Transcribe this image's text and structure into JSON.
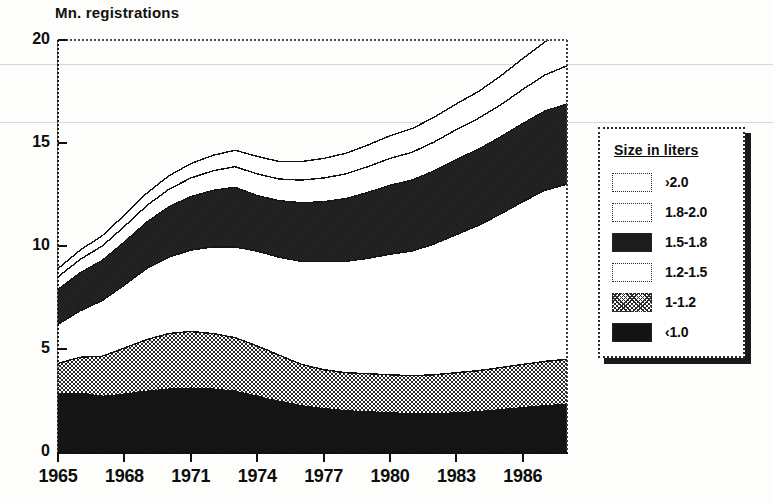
{
  "chart_data": {
    "type": "area",
    "stacked": true,
    "title": "",
    "ylabel": "Mn. registrations",
    "xlabel": "",
    "ylim": [
      0,
      20
    ],
    "yticks": [
      0,
      5,
      10,
      15,
      20
    ],
    "xticks": [
      "1965",
      "1968",
      "1971",
      "1974",
      "1977",
      "1980",
      "1983",
      "1986"
    ],
    "xtick_years": [
      1965,
      1968,
      1971,
      1974,
      1977,
      1980,
      1983,
      1986
    ],
    "x_range": [
      1965,
      1988
    ],
    "grid": false,
    "legend_position": "right",
    "legend_title": "Size in liters",
    "x": [
      1965,
      1966,
      1967,
      1968,
      1969,
      1970,
      1971,
      1972,
      1973,
      1974,
      1975,
      1976,
      1977,
      1978,
      1979,
      1980,
      1981,
      1982,
      1983,
      1984,
      1985,
      1986,
      1987,
      1988
    ],
    "series": [
      {
        "name": "<1.0",
        "style": "black",
        "values": [
          2.8,
          2.85,
          2.7,
          2.8,
          2.95,
          3.05,
          3.1,
          3.05,
          2.95,
          2.7,
          2.45,
          2.25,
          2.1,
          2.0,
          1.95,
          1.9,
          1.85,
          1.85,
          1.9,
          1.95,
          2.05,
          2.15,
          2.25,
          2.3
        ]
      },
      {
        "name": "1-1.2",
        "style": "gray-hatch",
        "values": [
          1.5,
          1.75,
          1.95,
          2.25,
          2.5,
          2.7,
          2.75,
          2.7,
          2.6,
          2.45,
          2.25,
          2.0,
          1.9,
          1.85,
          1.85,
          1.85,
          1.85,
          1.9,
          1.95,
          2.0,
          2.05,
          2.1,
          2.15,
          2.2
        ]
      },
      {
        "name": "1.2-1.5",
        "style": "white",
        "values": [
          1.9,
          2.25,
          2.7,
          3.05,
          3.45,
          3.7,
          3.95,
          4.2,
          4.4,
          4.6,
          4.75,
          5.0,
          5.25,
          5.4,
          5.6,
          5.85,
          6.05,
          6.35,
          6.7,
          7.05,
          7.45,
          7.9,
          8.3,
          8.5
        ]
      },
      {
        "name": "1.5-1.8",
        "style": "dark",
        "values": [
          1.7,
          1.85,
          1.95,
          2.1,
          2.25,
          2.45,
          2.6,
          2.75,
          2.9,
          2.7,
          2.75,
          2.85,
          2.9,
          3.05,
          3.2,
          3.35,
          3.45,
          3.55,
          3.65,
          3.7,
          3.75,
          3.8,
          3.85,
          3.9
        ]
      },
      {
        "name": "1.8-2.0",
        "style": "white",
        "values": [
          0.6,
          0.65,
          0.7,
          0.75,
          0.8,
          0.85,
          0.9,
          0.95,
          1.0,
          1.05,
          1.05,
          1.1,
          1.15,
          1.2,
          1.25,
          1.3,
          1.35,
          1.4,
          1.45,
          1.5,
          1.55,
          1.65,
          1.75,
          1.85
        ]
      },
      {
        "name": ">2.0",
        "style": "white",
        "values": [
          0.4,
          0.45,
          0.5,
          0.55,
          0.6,
          0.65,
          0.7,
          0.75,
          0.8,
          0.85,
          0.85,
          0.9,
          0.95,
          1.0,
          1.05,
          1.1,
          1.15,
          1.2,
          1.25,
          1.3,
          1.4,
          1.5,
          1.6,
          1.75
        ]
      }
    ],
    "totals": [
      8.9,
      9.8,
      10.5,
      11.5,
      12.55,
      13.4,
      14.0,
      14.4,
      14.65,
      14.35,
      14.1,
      14.1,
      14.25,
      14.5,
      14.9,
      15.35,
      15.7,
      16.25,
      16.9,
      17.5,
      18.25,
      19.1,
      19.9,
      20.5
    ]
  },
  "axis": {
    "ylabel_text": "Mn. registrations",
    "yticks": [
      "20",
      "15",
      "10",
      "5",
      "0"
    ],
    "ytick_values": [
      20,
      15,
      10,
      5,
      0
    ],
    "xticks": [
      "1965",
      "1968",
      "1971",
      "1974",
      "1977",
      "1980",
      "1983",
      "1986"
    ]
  },
  "legend": {
    "title": "Size in liters",
    "items": [
      {
        "label": "›2.0",
        "style": "white"
      },
      {
        "label": "1.8-2.0",
        "style": "white"
      },
      {
        "label": "1.5-1.8",
        "style": "dark"
      },
      {
        "label": "1.2-1.5",
        "style": "white"
      },
      {
        "label": "1-1.2",
        "style": "gray"
      },
      {
        "label": "‹1.0",
        "style": "black"
      }
    ]
  },
  "colors": {
    "ink": "#0d0d0d",
    "black_band": "#141414",
    "dark_band": "#1c1c1c",
    "gray_band": "#6b6b6b",
    "white_band": "#ffffff",
    "background": "#fdfdfb",
    "scanline": "#cfcfcf"
  }
}
